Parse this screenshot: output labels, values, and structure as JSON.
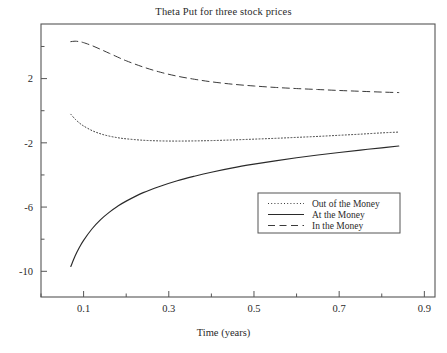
{
  "chart_data": {
    "type": "line",
    "title": "Theta Put for three stock prices",
    "xlabel": "Time (years)",
    "ylabel": "",
    "xlim": [
      0.0,
      0.925
    ],
    "ylim": [
      -11.6,
      5.4
    ],
    "grid": false,
    "legend_position": "lower right",
    "xticks": [
      0.1,
      0.3,
      0.5,
      0.7,
      0.9
    ],
    "xtick_labels": [
      "0.1",
      "0.3",
      "0.5",
      "0.7",
      "0.9"
    ],
    "xminor_ticks": [
      0.0,
      0.2,
      0.4,
      0.6,
      0.8
    ],
    "yticks": [
      2,
      -2,
      -6,
      -10
    ],
    "ytick_labels": [
      "2",
      "-2",
      "-6",
      "-10"
    ],
    "yminor_ticks": [
      4,
      0,
      -4,
      -8
    ],
    "x": [
      0.07,
      0.08,
      0.09,
      0.1,
      0.12,
      0.14,
      0.16,
      0.18,
      0.2,
      0.24,
      0.28,
      0.32,
      0.36,
      0.4,
      0.45,
      0.5,
      0.55,
      0.6,
      0.65,
      0.7,
      0.75,
      0.8,
      0.84
    ],
    "series": [
      {
        "name": "Out of the Money",
        "style": "dotted",
        "color": "#3b3b3b",
        "values": [
          -0.22,
          -0.52,
          -0.76,
          -0.95,
          -1.24,
          -1.44,
          -1.58,
          -1.68,
          -1.75,
          -1.84,
          -1.88,
          -1.89,
          -1.88,
          -1.86,
          -1.82,
          -1.77,
          -1.72,
          -1.66,
          -1.6,
          -1.53,
          -1.46,
          -1.38,
          -1.33
        ]
      },
      {
        "name": "At the Money",
        "style": "solid",
        "color": "#2a2a2a",
        "values": [
          -9.7,
          -9.05,
          -8.52,
          -8.07,
          -7.35,
          -6.78,
          -6.33,
          -5.95,
          -5.63,
          -5.1,
          -4.7,
          -4.36,
          -4.08,
          -3.83,
          -3.56,
          -3.33,
          -3.12,
          -2.93,
          -2.76,
          -2.6,
          -2.45,
          -2.31,
          -2.2
        ]
      },
      {
        "name": "In the Money",
        "style": "dashed",
        "color": "#3b3b3b",
        "values": [
          4.3,
          4.33,
          4.3,
          4.24,
          4.05,
          3.82,
          3.58,
          3.34,
          3.11,
          2.72,
          2.4,
          2.15,
          1.96,
          1.8,
          1.65,
          1.54,
          1.45,
          1.38,
          1.32,
          1.26,
          1.21,
          1.16,
          1.13
        ]
      }
    ]
  },
  "legend": {
    "items": [
      {
        "label": "Out of the Money"
      },
      {
        "label": "At the Money"
      },
      {
        "label": "In the Money"
      }
    ]
  }
}
